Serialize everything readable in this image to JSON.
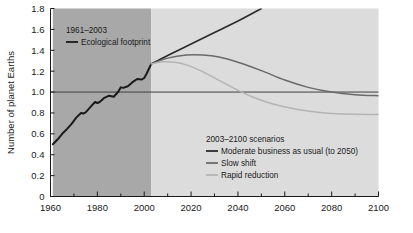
{
  "chart_data": {
    "type": "line",
    "title": "",
    "xlabel": "",
    "ylabel": "Number of planet Earths",
    "xlim": [
      1960,
      2100
    ],
    "ylim": [
      0,
      1.8
    ],
    "grid": false,
    "xticks": [
      1960,
      1980,
      2000,
      2020,
      2040,
      2060,
      2080,
      2100
    ],
    "xtick_labels": [
      "1960",
      "1980",
      "2000",
      "2020",
      "2040",
      "2060",
      "2080",
      "2100"
    ],
    "xminor_step": 10,
    "yticks": [
      0,
      0.2,
      0.4,
      0.6,
      0.8,
      1.0,
      1.2,
      1.4,
      1.6,
      1.8
    ],
    "ytick_labels": [
      "0",
      "0.2",
      "0.4",
      "0.6",
      "0.8",
      "1.0",
      "1.2",
      "1.4",
      "1.6",
      "1.8"
    ],
    "reference_line": {
      "y": 1.0,
      "label": "",
      "color": "#3f3f3f"
    },
    "shaded_bands": [
      {
        "name": "historical-band",
        "x0": 1961,
        "x1": 2003,
        "color": "#a8a8a8"
      },
      {
        "name": "scenario-band",
        "x0": 2003,
        "x1": 2100,
        "color": "#dcdcdc"
      }
    ],
    "series": [
      {
        "name": "Ecological footprint",
        "period": "1961-2003",
        "color": "#1a1a1a",
        "width": 2.0,
        "x": [
          1961,
          1963,
          1965,
          1967,
          1969,
          1971,
          1973,
          1974,
          1975,
          1977,
          1979,
          1980,
          1981,
          1983,
          1985,
          1987,
          1989,
          1990,
          1991,
          1993,
          1995,
          1997,
          1999,
          2000,
          2001,
          2003
        ],
        "y": [
          0.5,
          0.545,
          0.6,
          0.645,
          0.695,
          0.755,
          0.8,
          0.795,
          0.805,
          0.855,
          0.905,
          0.895,
          0.905,
          0.945,
          0.965,
          0.955,
          1.005,
          1.045,
          1.04,
          1.055,
          1.095,
          1.125,
          1.12,
          1.135,
          1.175,
          1.27
        ]
      },
      {
        "name": "Moderate business as usual (to 2050)",
        "period": "2003-2050",
        "color": "#2b2b2b",
        "width": 1.6,
        "x": [
          2003,
          2010,
          2020,
          2030,
          2040,
          2050
        ],
        "y": [
          1.27,
          1.35,
          1.46,
          1.57,
          1.68,
          1.8
        ]
      },
      {
        "name": "Slow shift",
        "period": "2003-2100",
        "color": "#6a6a6a",
        "width": 1.5,
        "x": [
          2003,
          2010,
          2018,
          2025,
          2032,
          2040,
          2050,
          2060,
          2070,
          2080,
          2090,
          2100
        ],
        "y": [
          1.27,
          1.325,
          1.355,
          1.355,
          1.335,
          1.285,
          1.205,
          1.115,
          1.045,
          1.0,
          0.975,
          0.965
        ]
      },
      {
        "name": "Rapid reduction",
        "period": "2003-2100",
        "color": "#b4b4b4",
        "width": 1.5,
        "x": [
          2003,
          2008,
          2013,
          2018,
          2024,
          2030,
          2038,
          2046,
          2055,
          2065,
          2075,
          2085,
          2100
        ],
        "y": [
          1.27,
          1.29,
          1.285,
          1.26,
          1.205,
          1.135,
          1.04,
          0.955,
          0.885,
          0.835,
          0.805,
          0.79,
          0.785
        ]
      }
    ]
  },
  "legends": {
    "historical": {
      "title": "1961–2003",
      "entries": [
        {
          "label": "Ecological footprint",
          "color": "#1a1a1a"
        }
      ]
    },
    "scenarios": {
      "title": "2003–2100 scenarios",
      "entries": [
        {
          "label": "Moderate business as usual (to 2050)",
          "color": "#2b2b2b"
        },
        {
          "label": "Slow shift",
          "color": "#6a6a6a"
        },
        {
          "label": "Rapid reduction",
          "color": "#b4b4b4"
        }
      ]
    }
  }
}
